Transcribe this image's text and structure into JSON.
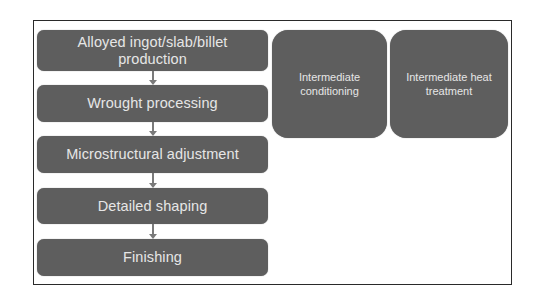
{
  "diagram": {
    "type": "process-flow",
    "steps": [
      {
        "label": "Alloyed ingot/slab/billet production"
      },
      {
        "label": "Wrought processing"
      },
      {
        "label": "Microstructural adjustment"
      },
      {
        "label": "Detailed shaping"
      },
      {
        "label": "Finishing"
      }
    ],
    "side_boxes": [
      {
        "label": "Intermediate conditioning"
      },
      {
        "label": "Intermediate heat treatment"
      }
    ],
    "colors": {
      "box_fill": "#5e5e5e",
      "box_text": "#e6e6e6",
      "arrow": "#7a7a7a",
      "frame": "#2a2a2a"
    }
  }
}
